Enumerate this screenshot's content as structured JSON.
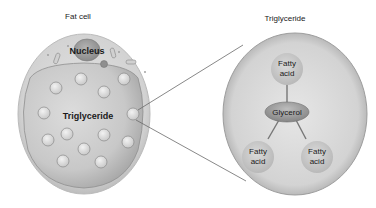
{
  "fat_cell": {
    "title": "Fat cell",
    "nucleus_label": "Nucleus",
    "content_label": "Triglyceride"
  },
  "triglyceride": {
    "title": "Triglyceride",
    "center_label": "Glycerol",
    "fatty_acids": [
      {
        "line1": "Fatty",
        "line2": "acid"
      },
      {
        "line1": "Fatty",
        "line2": "acid"
      },
      {
        "line1": "Fatty",
        "line2": "acid"
      }
    ]
  },
  "colors": {
    "cell_outer": "#d6d6d6",
    "cell_inner": "#c4c4c4",
    "droplet": "#d9d9d9",
    "nucleus": "#9a9a9a",
    "big_circle": "#cdcdcd",
    "glycerol": "#9f9f9f",
    "fatty_acid": "#c6c6c6",
    "line": "#6a6a6a"
  }
}
